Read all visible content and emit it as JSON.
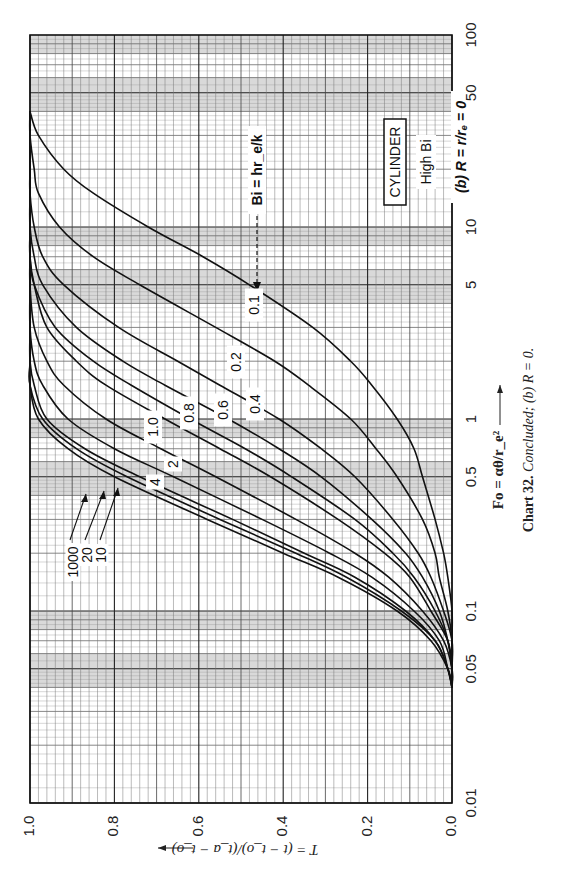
{
  "page": {
    "corner_text": "Charts"
  },
  "chart_data": {
    "type": "line",
    "title": "CYLINDER",
    "subtitle": "High Bi",
    "panel_label": "(b) R = r/r_e = 0",
    "caption": "Chart 32. Concluded; (b) R = 0.",
    "caption_number": "Chart 32.",
    "caption_text": "Concluded; (b) R = 0.",
    "xlabel": "Fo = αθ/r_e²",
    "ylabel": "T = (t − t_o)/(t_a − t_o)",
    "parameter_label": "Bi = hr_e/k",
    "x_scale": "log",
    "xlim": [
      0.01,
      100
    ],
    "ylim": [
      0.0,
      1.0
    ],
    "x_ticks": [
      0.01,
      0.05,
      0.1,
      0.5,
      1,
      5,
      10,
      50,
      100
    ],
    "x_tick_labels": [
      "0.01",
      "0.05",
      "0.1",
      "0.5",
      "1",
      "5",
      "10",
      "50",
      "100"
    ],
    "y_ticks": [
      0.0,
      0.2,
      0.4,
      0.6,
      0.8,
      1.0
    ],
    "y_tick_labels": [
      "0.0",
      "0.2",
      "0.4",
      "0.6",
      "0.8",
      "1.0"
    ],
    "grid": true,
    "orientation": "rotated 90° clockwise on page",
    "x": [
      0.04,
      0.05,
      0.07,
      0.1,
      0.15,
      0.2,
      0.3,
      0.5,
      0.7,
      1,
      1.5,
      2,
      3,
      5,
      7,
      10,
      15,
      20,
      30,
      40
    ],
    "series": [
      {
        "name": "Bi = 1000",
        "values": [
          0.0,
          0.01,
          0.05,
          0.13,
          0.27,
          0.4,
          0.58,
          0.8,
          0.91,
          0.98,
          1.0,
          1.0,
          1.0,
          1.0,
          1.0,
          1.0,
          1.0,
          1.0,
          1.0,
          1.0
        ]
      },
      {
        "name": "Bi = 20",
        "values": [
          0.0,
          0.01,
          0.04,
          0.12,
          0.25,
          0.37,
          0.55,
          0.77,
          0.89,
          0.97,
          1.0,
          1.0,
          1.0,
          1.0,
          1.0,
          1.0,
          1.0,
          1.0,
          1.0,
          1.0
        ]
      },
      {
        "name": "Bi = 10",
        "values": [
          0.0,
          0.01,
          0.04,
          0.11,
          0.23,
          0.35,
          0.52,
          0.74,
          0.87,
          0.96,
          0.99,
          1.0,
          1.0,
          1.0,
          1.0,
          1.0,
          1.0,
          1.0,
          1.0,
          1.0
        ]
      },
      {
        "name": "Bi = 4",
        "values": [
          0.0,
          0.01,
          0.03,
          0.09,
          0.19,
          0.29,
          0.45,
          0.66,
          0.8,
          0.91,
          0.97,
          0.99,
          1.0,
          1.0,
          1.0,
          1.0,
          1.0,
          1.0,
          1.0,
          1.0
        ]
      },
      {
        "name": "Bi = 2",
        "values": [
          0.0,
          0.0,
          0.02,
          0.07,
          0.15,
          0.23,
          0.37,
          0.56,
          0.69,
          0.82,
          0.92,
          0.96,
          0.99,
          1.0,
          1.0,
          1.0,
          1.0,
          1.0,
          1.0,
          1.0
        ]
      },
      {
        "name": "Bi = 1.0",
        "values": [
          0.0,
          0.0,
          0.01,
          0.05,
          0.1,
          0.16,
          0.27,
          0.43,
          0.55,
          0.68,
          0.82,
          0.89,
          0.96,
          0.99,
          1.0,
          1.0,
          1.0,
          1.0,
          1.0,
          1.0
        ]
      },
      {
        "name": "Bi = 0.8",
        "values": [
          0.0,
          0.0,
          0.01,
          0.04,
          0.09,
          0.14,
          0.23,
          0.38,
          0.49,
          0.62,
          0.76,
          0.85,
          0.94,
          0.99,
          1.0,
          1.0,
          1.0,
          1.0,
          1.0,
          1.0
        ]
      },
      {
        "name": "Bi = 0.6",
        "values": [
          0.0,
          0.0,
          0.01,
          0.03,
          0.07,
          0.11,
          0.19,
          0.31,
          0.41,
          0.53,
          0.68,
          0.78,
          0.89,
          0.97,
          0.99,
          1.0,
          1.0,
          1.0,
          1.0,
          1.0
        ]
      },
      {
        "name": "Bi = 0.4",
        "values": [
          0.0,
          0.0,
          0.0,
          0.02,
          0.05,
          0.08,
          0.14,
          0.23,
          0.31,
          0.41,
          0.55,
          0.65,
          0.79,
          0.92,
          0.97,
          0.99,
          1.0,
          1.0,
          1.0,
          1.0
        ]
      },
      {
        "name": "Bi = 0.2",
        "values": [
          0.0,
          0.0,
          0.0,
          0.01,
          0.03,
          0.04,
          0.07,
          0.13,
          0.18,
          0.24,
          0.34,
          0.42,
          0.56,
          0.74,
          0.85,
          0.93,
          0.98,
          0.99,
          1.0,
          1.0
        ]
      },
      {
        "name": "Bi = 0.1",
        "values": [
          0.0,
          0.0,
          0.0,
          0.0,
          0.01,
          0.02,
          0.04,
          0.07,
          0.09,
          0.13,
          0.19,
          0.24,
          0.33,
          0.48,
          0.59,
          0.72,
          0.85,
          0.92,
          0.98,
          1.0
        ]
      }
    ],
    "curve_labels": [
      "1000",
      "20",
      "10",
      "4",
      "2",
      "1.0",
      "0.8",
      "0.6",
      "0.4",
      "0.2",
      "0.1"
    ]
  }
}
